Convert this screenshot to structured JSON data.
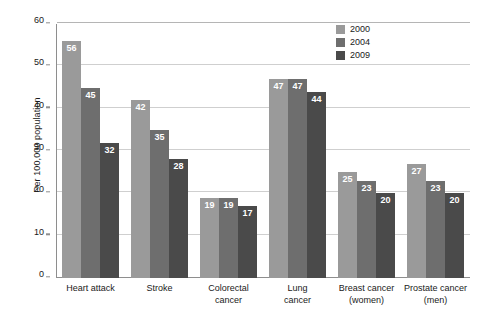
{
  "chart_data": {
    "type": "bar",
    "title": "",
    "subtitle": "",
    "xlabel": "",
    "ylabel": "Per 100,000 population",
    "ylim": [
      0,
      60
    ],
    "yticks": [
      0,
      10,
      20,
      30,
      40,
      50,
      60
    ],
    "grid": true,
    "legend_position": "top-right",
    "categories": [
      "Heart attack",
      "Stroke",
      "Colorectal cancer",
      "Lung cancer",
      "Breast cancer (women)",
      "Prostate cancer (men)"
    ],
    "category_lines": [
      [
        "Heart attack"
      ],
      [
        "Stroke"
      ],
      [
        "Colorectal",
        "cancer"
      ],
      [
        "Lung",
        "cancer"
      ],
      [
        "Breast cancer",
        "(women)"
      ],
      [
        "Prostate cancer",
        "(men)"
      ]
    ],
    "series": [
      {
        "name": "2000",
        "color": "#9a9a9a",
        "values": [
          56,
          42,
          19,
          47,
          25,
          27
        ]
      },
      {
        "name": "2004",
        "color": "#6e6e6e",
        "values": [
          45,
          35,
          19,
          47,
          23,
          23
        ]
      },
      {
        "name": "2009",
        "color": "#4a4a4a",
        "values": [
          32,
          28,
          17,
          44,
          20,
          20
        ]
      }
    ]
  },
  "legend": {
    "items": [
      {
        "label": "2000",
        "color": "#9a9a9a"
      },
      {
        "label": "2004",
        "color": "#6e6e6e"
      },
      {
        "label": "2009",
        "color": "#4a4a4a"
      }
    ]
  },
  "axis": {
    "y_title": "Per 100,000 population",
    "y_tick_labels": [
      "0",
      "10",
      "20",
      "30",
      "40",
      "50",
      "60"
    ],
    "axis_color": "#8e8e8e",
    "grid_color": "#cfcfcf"
  }
}
